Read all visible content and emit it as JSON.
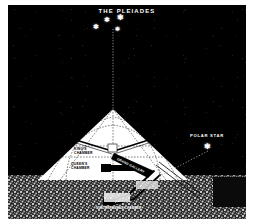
{
  "figure": {
    "title": "THE PLEIADES",
    "sky_color": "#000000",
    "pyramid_color": "#ffffff",
    "ground_color": "#8f8f8f"
  },
  "sky": {
    "cluster_label": "THE PLEIADES",
    "stars": [
      {
        "name": "pleiad-star-1",
        "x": 119,
        "y": 21,
        "size": 5
      },
      {
        "name": "pleiad-star-2",
        "x": 108,
        "y": 19,
        "size": 4
      },
      {
        "name": "pleiad-star-3",
        "x": 97,
        "y": 28,
        "size": 4
      },
      {
        "name": "pleiad-star-4",
        "x": 118,
        "y": 31,
        "size": 4
      }
    ],
    "polar_star": {
      "label": "POLAR STAR",
      "label_x": 193,
      "label_y": 134,
      "star_x": 206,
      "star_y": 146,
      "size": 5
    }
  },
  "pyramid": {
    "apex_label": "apex",
    "chambers": [
      {
        "name": "kings-chamber",
        "line1": "KING'S",
        "line2": "CHAMBER",
        "x": 74,
        "y": 150
      },
      {
        "name": "queens-chamber",
        "line1": "QUEEN'S",
        "line2": "CHAMBER",
        "x": 72,
        "y": 165
      }
    ],
    "shaft_label": "GRAND GALLERY",
    "subterranean_label": "SUBTERRANEAN CHAMBER"
  },
  "rays": {
    "pleiades_ray": "vertical dotted ray from Pleiades to pyramid apex",
    "polar_ray": "dotted ray from Polar Star to descending passage"
  }
}
